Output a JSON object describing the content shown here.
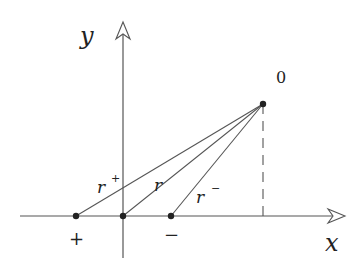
{
  "diagram": {
    "axes": {
      "x_label": "x",
      "y_label": "y"
    },
    "points": {
      "apex_label": "0",
      "plus_label": "+",
      "minus_label": "−"
    },
    "segments": {
      "r_plus": {
        "base": "r",
        "sup": "+"
      },
      "r": {
        "base": "r"
      },
      "r_minus": {
        "base": "r",
        "sup": "−"
      }
    },
    "colors": {
      "line": "#555555",
      "point": "#222222",
      "text": "#222222"
    }
  }
}
